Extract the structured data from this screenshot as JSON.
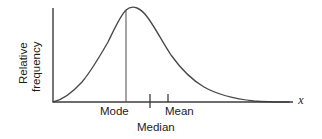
{
  "figure": {
    "background_color": "#ffffff",
    "line_color": "#4a4a4a",
    "axis_color": "#3c3c3c",
    "text_color": "#1c1c1c"
  },
  "axes": {
    "y_label_line1": "Relative",
    "y_label_line2": "frequency",
    "x_label": "x",
    "y_axis_top_y": 8,
    "y_axis_bottom_y": 102,
    "y_axis_x": 53,
    "x_axis_left_x": 53,
    "x_axis_right_x": 293,
    "x_axis_y": 102,
    "grid": false
  },
  "annotations": [
    {
      "name": "mode",
      "label": "Mode",
      "x_px": 126,
      "label_x_px": 100,
      "label_y_px": 115,
      "marker": "vertical-line-to-peak",
      "tick_top_y": 10,
      "tick_bottom_y": 102
    },
    {
      "name": "median",
      "label": "Median",
      "x_px": 150,
      "label_x_px": 137,
      "label_y_px": 131,
      "marker": "tick-crossing-axis",
      "tick_top_y": 94,
      "tick_bottom_y": 108
    },
    {
      "name": "mean",
      "label": "Mean",
      "x_px": 168,
      "label_x_px": 165,
      "label_y_px": 115,
      "marker": "tick-above-axis",
      "tick_top_y": 94,
      "tick_bottom_y": 102
    }
  ],
  "chart_data": {
    "type": "line",
    "title": "",
    "subtitle": "",
    "xlabel": "x",
    "ylabel": "Relative frequency",
    "grid": false,
    "legend": null,
    "xlim": [
      0,
      1
    ],
    "ylim": [
      0,
      1
    ],
    "curve_path": "M 53 102 C 62 100 72 93 82 82 C 92 70 100 56 108 42 C 114 30 120 16 126 10 C 133 4 141 8 148 18 C 156 29 163 43 171 55 C 181 69 192 80 204 87 C 218 95 236 99 254 101 C 266 102 280 102 289 102",
    "curve_points_px": [
      {
        "x": 53,
        "y": 102
      },
      {
        "x": 66,
        "y": 98
      },
      {
        "x": 78,
        "y": 88
      },
      {
        "x": 90,
        "y": 73
      },
      {
        "x": 101,
        "y": 56
      },
      {
        "x": 110,
        "y": 39
      },
      {
        "x": 118,
        "y": 23
      },
      {
        "x": 126,
        "y": 10
      },
      {
        "x": 134,
        "y": 8
      },
      {
        "x": 143,
        "y": 14
      },
      {
        "x": 152,
        "y": 24
      },
      {
        "x": 162,
        "y": 38
      },
      {
        "x": 173,
        "y": 53
      },
      {
        "x": 186,
        "y": 68
      },
      {
        "x": 200,
        "y": 81
      },
      {
        "x": 216,
        "y": 90
      },
      {
        "x": 234,
        "y": 96
      },
      {
        "x": 254,
        "y": 100
      },
      {
        "x": 272,
        "y": 101
      },
      {
        "x": 289,
        "y": 102
      }
    ],
    "markers": [
      {
        "label": "Mode",
        "x_px": 126
      },
      {
        "label": "Median",
        "x_px": 150
      },
      {
        "label": "Mean",
        "x_px": 168
      }
    ],
    "relationship": "Mode < Median < Mean"
  }
}
